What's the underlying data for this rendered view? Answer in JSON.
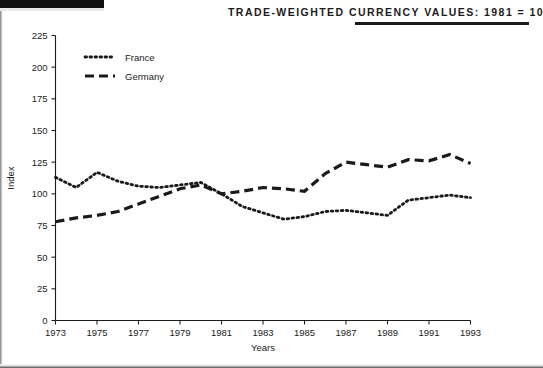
{
  "header": {
    "title": "Trade-Weighted Currency Values: 1981 = 100"
  },
  "chart_data": {
    "type": "line",
    "title": "Trade-Weighted Currency Values: 1981 = 100",
    "xlabel": "Years",
    "ylabel": "Index",
    "xlim": [
      1973,
      1993
    ],
    "ylim": [
      0,
      225
    ],
    "ytick_labels": [
      "0",
      "25",
      "50",
      "75",
      "100",
      "125",
      "150",
      "175",
      "200",
      "225"
    ],
    "yticks": [
      0,
      25,
      50,
      75,
      100,
      125,
      150,
      175,
      200,
      225
    ],
    "xtick_labels": [
      "1973",
      "1975",
      "1977",
      "1979",
      "1981",
      "1983",
      "1985",
      "1987",
      "1989",
      "1991",
      "1993"
    ],
    "xticks": [
      1973,
      1975,
      1977,
      1979,
      1981,
      1983,
      1985,
      1987,
      1989,
      1991,
      1993
    ],
    "grid": false,
    "legend_position": "top-left",
    "x": [
      1973,
      1974,
      1975,
      1976,
      1977,
      1978,
      1979,
      1980,
      1981,
      1982,
      1983,
      1984,
      1985,
      1986,
      1987,
      1988,
      1989,
      1990,
      1991,
      1992,
      1993
    ],
    "series": [
      {
        "name": "France",
        "style": "dotted",
        "color": "#1a1a1a",
        "values": [
          113,
          105,
          117,
          110,
          106,
          105,
          107,
          109,
          100,
          90,
          85,
          80,
          82,
          86,
          87,
          85,
          83,
          95,
          97,
          99,
          97
        ]
      },
      {
        "name": "Germany",
        "style": "dashed",
        "color": "#1a1a1a",
        "values": [
          78,
          81,
          83,
          86,
          92,
          98,
          104,
          107,
          100,
          102,
          105,
          104,
          102,
          116,
          125,
          123,
          121,
          127,
          126,
          131,
          124
        ]
      }
    ]
  }
}
